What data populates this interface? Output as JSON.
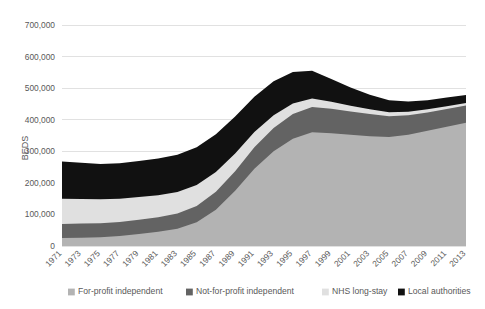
{
  "chart_data": {
    "type": "area",
    "stacked": true,
    "title": "",
    "xlabel": "",
    "ylabel": "BEDS",
    "ylim": [
      0,
      700000
    ],
    "ytick_step": 100000,
    "ytick_labels": [
      "0",
      "100,000",
      "200,000",
      "300,000",
      "400,000",
      "500,000",
      "600,000",
      "700,000"
    ],
    "ytick_values": [
      0,
      100000,
      200000,
      300000,
      400000,
      500000,
      600000,
      700000
    ],
    "grid": true,
    "legend_position": "bottom",
    "categories": [
      "1971",
      "1973",
      "1975",
      "1977",
      "1979",
      "1981",
      "1983",
      "1985",
      "1987",
      "1989",
      "1991",
      "1993",
      "1995",
      "1997",
      "1999",
      "2001",
      "2003",
      "2005",
      "2007",
      "2009",
      "2011",
      "2013"
    ],
    "series": [
      {
        "name": "For-profit independent",
        "color": "#b3b3b3",
        "values": [
          25000,
          26000,
          28000,
          32000,
          38000,
          45000,
          55000,
          75000,
          115000,
          175000,
          245000,
          300000,
          340000,
          360000,
          357000,
          352000,
          348000,
          345000,
          352000,
          365000,
          378000,
          390000
        ]
      },
      {
        "name": "Not-for-profit independent",
        "color": "#636363",
        "values": [
          45000,
          45000,
          44000,
          44000,
          45000,
          46000,
          48000,
          52000,
          57000,
          62000,
          68000,
          74000,
          78000,
          80000,
          78000,
          74000,
          70000,
          66000,
          62000,
          58000,
          56000,
          55000
        ]
      },
      {
        "name": "NHS long-stay",
        "color": "#e0e0e0",
        "values": [
          80000,
          78000,
          76000,
          74000,
          72000,
          70000,
          68000,
          66000,
          62000,
          56000,
          48000,
          40000,
          33000,
          27000,
          22000,
          18000,
          15000,
          13000,
          11000,
          10000,
          9000,
          8000
        ]
      },
      {
        "name": "Local authorities",
        "color": "#111111",
        "values": [
          118000,
          115000,
          112000,
          112000,
          114000,
          116000,
          118000,
          120000,
          120000,
          117000,
          112000,
          108000,
          100000,
          88000,
          72000,
          58000,
          46000,
          38000,
          33000,
          29000,
          27000,
          25000
        ]
      }
    ]
  },
  "legend": {
    "items": [
      {
        "label": "For-profit independent",
        "color": "#b3b3b3"
      },
      {
        "label": "Not-for-profit independent",
        "color": "#636363"
      },
      {
        "label": "NHS long-stay",
        "color": "#e0e0e0"
      },
      {
        "label": "Local authorities",
        "color": "#111111"
      }
    ]
  }
}
